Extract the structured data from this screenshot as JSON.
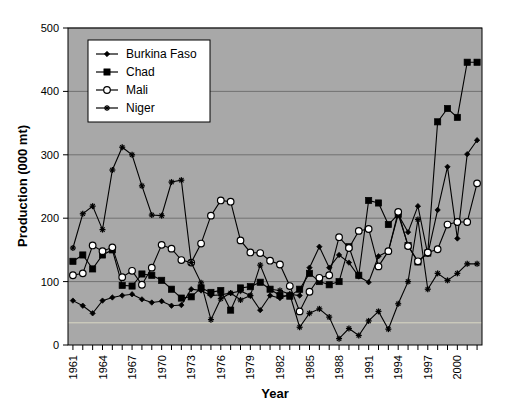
{
  "chart_data": {
    "type": "line",
    "title": "",
    "xlabel": "Year",
    "ylabel": "Production (000 mt)",
    "xlim": [
      1961,
      2002
    ],
    "ylim": [
      0,
      500
    ],
    "yticks": [
      0,
      100,
      200,
      300,
      400,
      500
    ],
    "xticks_labeled": [
      "1961",
      "1964",
      "1967",
      "1970",
      "1973",
      "1976",
      "1979",
      "1982",
      "1985",
      "1988",
      "1991",
      "1994",
      "1997",
      "2000"
    ],
    "grid": true,
    "legend_position": "top-left",
    "x": [
      1961,
      1962,
      1963,
      1964,
      1965,
      1966,
      1967,
      1968,
      1969,
      1970,
      1971,
      1972,
      1973,
      1974,
      1975,
      1976,
      1977,
      1978,
      1979,
      1980,
      1981,
      1982,
      1983,
      1984,
      1985,
      1986,
      1987,
      1988,
      1989,
      1990,
      1991,
      1992,
      1993,
      1994,
      1995,
      1996,
      1997,
      1998,
      1999,
      2000,
      2001,
      2002
    ],
    "series": [
      {
        "name": "Burkina Faso",
        "marker": "diamond",
        "values": [
          70,
          62,
          50,
          70,
          75,
          78,
          80,
          72,
          67,
          69,
          62,
          63,
          88,
          86,
          78,
          79,
          82,
          85,
          78,
          55,
          78,
          74,
          80,
          78,
          122,
          155,
          122,
          142,
          130,
          108,
          99,
          140,
          148,
          206,
          178,
          219,
          143,
          213,
          281,
          168,
          301,
          323
        ]
      },
      {
        "name": "Chad",
        "marker": "square",
        "values": [
          132,
          142,
          120,
          142,
          150,
          94,
          93,
          112,
          110,
          102,
          88,
          74,
          76,
          90,
          83,
          86,
          55,
          90,
          92,
          99,
          88,
          78,
          77,
          88,
          113,
          100,
          95,
          100,
          155,
          110,
          228,
          224,
          190,
          206,
          157,
          131,
          145,
          352,
          373,
          359,
          446,
          446
        ]
      },
      {
        "name": "Mali",
        "marker": "circle-open",
        "values": [
          110,
          113,
          157,
          148,
          154,
          107,
          117,
          95,
          122,
          158,
          152,
          134,
          130,
          160,
          204,
          228,
          226,
          165,
          146,
          145,
          133,
          127,
          93,
          53,
          84,
          106,
          110,
          170,
          153,
          180,
          183,
          124,
          148,
          210,
          156,
          132,
          146,
          151,
          190,
          194,
          194,
          255
        ]
      },
      {
        "name": "Niger",
        "marker": "star",
        "values": [
          153,
          207,
          219,
          182,
          276,
          312,
          300,
          251,
          205,
          204,
          257,
          260,
          130,
          98,
          40,
          73,
          82,
          71,
          78,
          126,
          88,
          86,
          80,
          28,
          50,
          57,
          44,
          10,
          26,
          15,
          38,
          53,
          25,
          65,
          100,
          198,
          88,
          113,
          102,
          113,
          128,
          128
        ]
      }
    ]
  },
  "legend": {
    "items": [
      {
        "label": "Burkina Faso"
      },
      {
        "label": "Chad"
      },
      {
        "label": "Mali"
      },
      {
        "label": "Niger"
      }
    ]
  },
  "axes": {
    "y_title": "Production (000 mt)",
    "x_title": "Year"
  }
}
